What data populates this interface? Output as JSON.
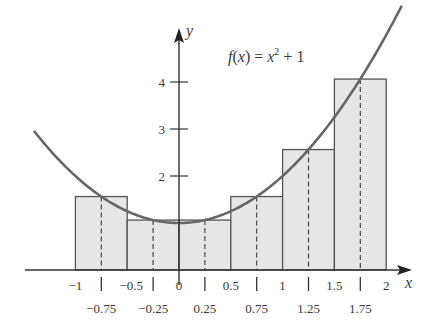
{
  "chart_data": {
    "type": "bar",
    "title": "",
    "function_label": "f(x) = x² + 1",
    "xlabel": "x",
    "ylabel": "y",
    "xlim": [
      -1,
      2
    ],
    "ylim": [
      0,
      4.5
    ],
    "grid": false,
    "bars": [
      {
        "x0": -1.0,
        "x1": -0.5,
        "midpoint": -0.75,
        "height": 1.5625
      },
      {
        "x0": -0.5,
        "x1": 0.0,
        "midpoint": -0.25,
        "height": 1.0625
      },
      {
        "x0": 0.0,
        "x1": 0.5,
        "midpoint": 0.25,
        "height": 1.0625
      },
      {
        "x0": 0.5,
        "x1": 1.0,
        "midpoint": 0.75,
        "height": 1.5625
      },
      {
        "x0": 1.0,
        "x1": 1.5,
        "midpoint": 1.25,
        "height": 2.5625
      },
      {
        "x0": 1.5,
        "x1": 2.0,
        "midpoint": 1.75,
        "height": 4.0625
      }
    ],
    "curve": {
      "name": "f(x) = x^2 + 1",
      "x_range": [
        -1.4,
        2.15
      ]
    },
    "x_ticks_top": [
      "-1",
      "-0.5",
      "0",
      "0.5",
      "1",
      "1.5",
      "2"
    ],
    "x_ticks_top_values": [
      -1,
      -0.5,
      0,
      0.5,
      1,
      1.5,
      2
    ],
    "x_ticks_bottom": [
      "−0.75",
      "−0.25",
      "0.25",
      "0.75",
      "1.25",
      "1.75"
    ],
    "x_ticks_bottom_values": [
      -0.75,
      -0.25,
      0.25,
      0.75,
      1.25,
      1.75
    ],
    "y_ticks": [
      "2",
      "3",
      "4"
    ],
    "y_ticks_values": [
      2,
      3,
      4
    ]
  },
  "colors": {
    "bar_fill": "#e6e6e6",
    "bar_stroke": "#555555",
    "curve": "#666666",
    "axis": "#333333"
  }
}
